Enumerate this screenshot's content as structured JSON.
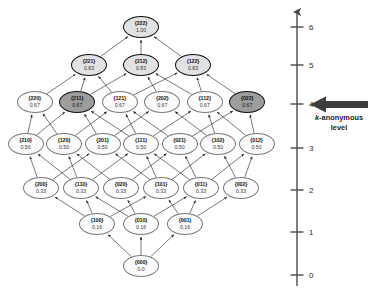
{
  "figure": {
    "type": "lattice-diagram",
    "background": "#ffffff"
  },
  "annotation": {
    "arrow_name": "left-arrow-icon",
    "arrow_color": "#3d3d3d",
    "arrow_points_to_level": 4,
    "caption_line1_italic": "k",
    "caption_line1_rest": "-anonymous",
    "caption_line2": "level"
  },
  "axis": {
    "name": "level-axis",
    "orientation": "vertical",
    "arrow_at_top": true,
    "ticks": [
      "6",
      "5",
      "4",
      "3",
      "2",
      "1",
      "0"
    ],
    "tick_values": [
      6,
      5,
      4,
      3,
      2,
      1,
      0
    ],
    "color": "#4a4a4a"
  },
  "colors": {
    "node_fill_default": "#fbfbfb",
    "node_fill_emphasis": "#e2e2e2",
    "node_fill_selected": "#9d9d9d",
    "node_stroke_default": "#7a7a7a",
    "node_stroke_emphasis": "#111111",
    "edge_stroke": "#2e2e2e"
  },
  "chart_data": {
    "type": "diagram",
    "xlabel": "",
    "ylabel": "level",
    "ylim": [
      0,
      6
    ],
    "levels": [
      {
        "level": 6,
        "nodes": [
          {
            "id": "222",
            "label": "{222}",
            "value": "1.00",
            "numeric": 1.0,
            "style": "emph"
          }
        ]
      },
      {
        "level": 5,
        "nodes": [
          {
            "id": "221",
            "label": "{221}",
            "value": "0.83",
            "numeric": 0.83,
            "style": "emph"
          },
          {
            "id": "212",
            "label": "{212}",
            "value": "0.83",
            "numeric": 0.83,
            "style": "emph"
          },
          {
            "id": "122",
            "label": "{122}",
            "value": "0.83",
            "numeric": 0.83,
            "style": "emph"
          }
        ]
      },
      {
        "level": 4,
        "nodes": [
          {
            "id": "220",
            "label": "{220}",
            "value": "0.67",
            "numeric": 0.67,
            "style": "plain"
          },
          {
            "id": "211",
            "label": "{211}",
            "value": "0.67",
            "numeric": 0.67,
            "style": "sel"
          },
          {
            "id": "121",
            "label": "{121}",
            "value": "0.67",
            "numeric": 0.67,
            "style": "plain"
          },
          {
            "id": "202",
            "label": "{202}",
            "value": "0.67",
            "numeric": 0.67,
            "style": "plain"
          },
          {
            "id": "112",
            "label": "{112}",
            "value": "0.67",
            "numeric": 0.67,
            "style": "plain"
          },
          {
            "id": "022",
            "label": "{022}",
            "value": "0.67",
            "numeric": 0.67,
            "style": "sel"
          }
        ]
      },
      {
        "level": 3,
        "nodes": [
          {
            "id": "210",
            "label": "{210}",
            "value": "0.50",
            "numeric": 0.5,
            "style": "plain"
          },
          {
            "id": "120",
            "label": "{120}",
            "value": "0.50",
            "numeric": 0.5,
            "style": "plain"
          },
          {
            "id": "201",
            "label": "{201}",
            "value": "0.50",
            "numeric": 0.5,
            "style": "plain"
          },
          {
            "id": "111",
            "label": "{111}",
            "value": "0.50",
            "numeric": 0.5,
            "style": "plain"
          },
          {
            "id": "021",
            "label": "{021}",
            "value": "0.50",
            "numeric": 0.5,
            "style": "plain"
          },
          {
            "id": "102",
            "label": "{102}",
            "value": "0.50",
            "numeric": 0.5,
            "style": "plain"
          },
          {
            "id": "012",
            "label": "{012}",
            "value": "0.50",
            "numeric": 0.5,
            "style": "plain"
          }
        ]
      },
      {
        "level": 2,
        "nodes": [
          {
            "id": "200",
            "label": "{200}",
            "value": "0.33",
            "numeric": 0.33,
            "style": "plain"
          },
          {
            "id": "110",
            "label": "{110}",
            "value": "0.33",
            "numeric": 0.33,
            "style": "plain"
          },
          {
            "id": "020",
            "label": "{020}",
            "value": "0.33",
            "numeric": 0.33,
            "style": "plain"
          },
          {
            "id": "101",
            "label": "{101}",
            "value": "0.33",
            "numeric": 0.33,
            "style": "plain"
          },
          {
            "id": "011",
            "label": "{011}",
            "value": "0.33",
            "numeric": 0.33,
            "style": "plain"
          },
          {
            "id": "002",
            "label": "{002}",
            "value": "0.33",
            "numeric": 0.33,
            "style": "plain"
          }
        ]
      },
      {
        "level": 1,
        "nodes": [
          {
            "id": "100",
            "label": "{100}",
            "value": "0.16",
            "numeric": 0.16,
            "style": "plain"
          },
          {
            "id": "010",
            "label": "{010}",
            "value": "0.16",
            "numeric": 0.16,
            "style": "plain"
          },
          {
            "id": "001",
            "label": "{001}",
            "value": "0.16",
            "numeric": 0.16,
            "style": "plain"
          }
        ]
      },
      {
        "level": 0,
        "nodes": [
          {
            "id": "000",
            "label": "{000}",
            "value": "0.0",
            "numeric": 0.0,
            "style": "plain"
          }
        ]
      }
    ],
    "edges": [
      [
        "000",
        "100"
      ],
      [
        "000",
        "010"
      ],
      [
        "000",
        "001"
      ],
      [
        "100",
        "200"
      ],
      [
        "100",
        "110"
      ],
      [
        "100",
        "101"
      ],
      [
        "010",
        "110"
      ],
      [
        "010",
        "020"
      ],
      [
        "010",
        "011"
      ],
      [
        "001",
        "101"
      ],
      [
        "001",
        "011"
      ],
      [
        "001",
        "002"
      ],
      [
        "200",
        "210"
      ],
      [
        "200",
        "201"
      ],
      [
        "110",
        "210"
      ],
      [
        "110",
        "120"
      ],
      [
        "110",
        "111"
      ],
      [
        "020",
        "120"
      ],
      [
        "020",
        "021"
      ],
      [
        "101",
        "201"
      ],
      [
        "101",
        "111"
      ],
      [
        "101",
        "102"
      ],
      [
        "011",
        "111"
      ],
      [
        "011",
        "021"
      ],
      [
        "011",
        "012"
      ],
      [
        "002",
        "102"
      ],
      [
        "002",
        "012"
      ],
      [
        "210",
        "220"
      ],
      [
        "210",
        "211"
      ],
      [
        "120",
        "220"
      ],
      [
        "120",
        "121"
      ],
      [
        "201",
        "211"
      ],
      [
        "201",
        "202"
      ],
      [
        "111",
        "211"
      ],
      [
        "111",
        "121"
      ],
      [
        "111",
        "112"
      ],
      [
        "021",
        "121"
      ],
      [
        "021",
        "022"
      ],
      [
        "102",
        "202"
      ],
      [
        "102",
        "112"
      ],
      [
        "012",
        "112"
      ],
      [
        "012",
        "022"
      ],
      [
        "220",
        "221"
      ],
      [
        "211",
        "221"
      ],
      [
        "211",
        "212"
      ],
      [
        "121",
        "221"
      ],
      [
        "121",
        "122"
      ],
      [
        "202",
        "212"
      ],
      [
        "112",
        "212"
      ],
      [
        "112",
        "122"
      ],
      [
        "022",
        "122"
      ],
      [
        "221",
        "222"
      ],
      [
        "212",
        "222"
      ],
      [
        "122",
        "222"
      ]
    ]
  }
}
